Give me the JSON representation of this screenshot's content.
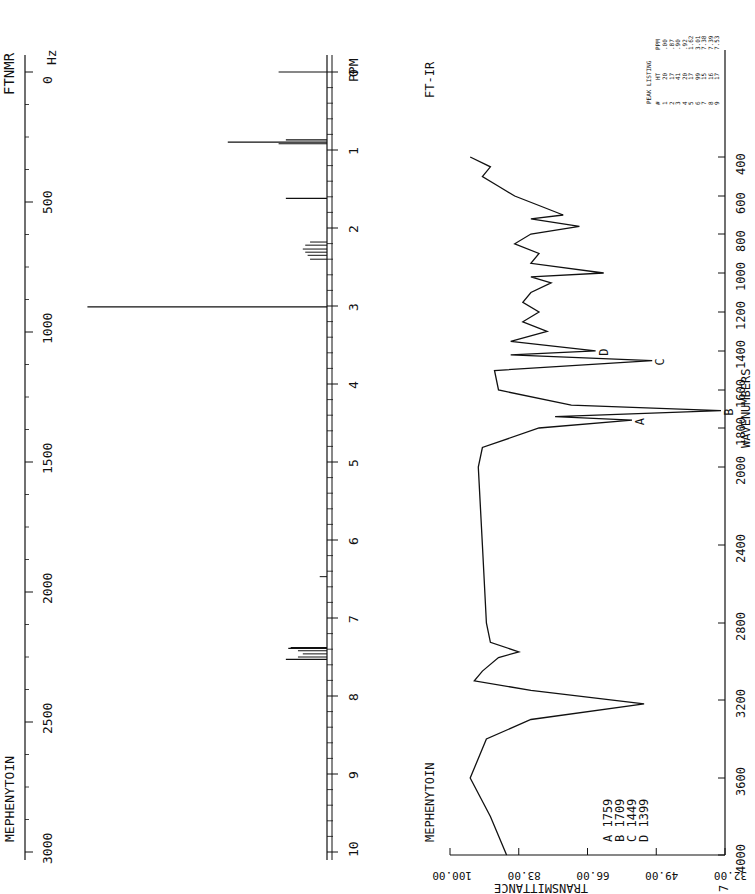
{
  "nmr": {
    "title": "FTNMR",
    "compound": "MEPHENYTOIN",
    "hz_unit": "Hz",
    "ppm_unit": "PPM",
    "hz_ticks": [
      "0",
      "500",
      "1000",
      "1500",
      "2000",
      "2500",
      "3000"
    ],
    "ppm_ticks": [
      "0",
      "1",
      "2",
      "3",
      "4",
      "5",
      "6",
      "7",
      "8",
      "9",
      "10"
    ],
    "peak_listing": {
      "title": "PEAK LISTING",
      "headers": [
        "#",
        "HT",
        "PPM"
      ],
      "rows": [
        [
          "1",
          "20",
          ".00"
        ],
        [
          "2",
          "17",
          ".87"
        ],
        [
          "3",
          "41",
          ".90"
        ],
        [
          "4",
          "20",
          ".92"
        ],
        [
          "5",
          "17",
          "1.62"
        ],
        [
          "6",
          "99",
          "3.01"
        ],
        [
          "7",
          "15",
          "7.38"
        ],
        [
          "8",
          "16",
          "7.39"
        ],
        [
          "9",
          "17",
          "7.53"
        ]
      ]
    }
  },
  "ir": {
    "title": "FT-IR",
    "compound": "MEPHENYTOIN",
    "xlabel": "WAVENUMBERS",
    "ylabel": "TRANSMITTANCE",
    "x_ticks": [
      "4000",
      "3600",
      "3200",
      "2800",
      "2400",
      "2000",
      "1800",
      "1600",
      "1400",
      "1200",
      "1000",
      "800",
      "600",
      "400"
    ],
    "y_ticks": [
      "32.00",
      "49.00",
      "66.00",
      "83.00",
      "100.00"
    ],
    "peaks": [
      {
        "label": "A",
        "wavenumber": "1759"
      },
      {
        "label": "B",
        "wavenumber": "1709"
      },
      {
        "label": "C",
        "wavenumber": "1449"
      },
      {
        "label": "D",
        "wavenumber": "1399"
      }
    ]
  },
  "corner_mark": "7",
  "chart_data": [
    {
      "type": "line",
      "title": "FTNMR — MEPHENYTOIN",
      "xlabel": "PPM",
      "x2label": "Hz",
      "xlim": [
        0,
        10
      ],
      "x2lim": [
        0,
        3000
      ],
      "grid": false,
      "peaks_ppm": [
        0.0,
        0.87,
        0.9,
        0.92,
        1.62,
        3.01,
        7.38,
        7.39,
        7.53
      ],
      "peak_heights": [
        20,
        17,
        41,
        20,
        17,
        99,
        15,
        16,
        17
      ],
      "extra_signals_ppm": [
        2.2,
        2.3,
        2.4,
        6.5
      ]
    },
    {
      "type": "line",
      "title": "FT-IR — MEPHENYTOIN",
      "xlabel": "WAVENUMBERS",
      "ylabel": "TRANSMITTANCE",
      "xlim": [
        4000,
        400
      ],
      "ylim": [
        32,
        100
      ],
      "grid": false,
      "x": [
        4000,
        3800,
        3600,
        3400,
        3300,
        3220,
        3150,
        3100,
        3050,
        2980,
        2950,
        2900,
        2800,
        2400,
        2000,
        1900,
        1800,
        1759,
        1740,
        1709,
        1680,
        1600,
        1500,
        1449,
        1420,
        1399,
        1350,
        1300,
        1250,
        1200,
        1150,
        1100,
        1050,
        1020,
        1000,
        950,
        900,
        850,
        800,
        760,
        720,
        700,
        650,
        600,
        550,
        500,
        450,
        400
      ],
      "y": [
        86,
        90,
        95,
        91,
        80,
        52,
        80,
        94,
        92,
        88,
        83,
        90,
        91,
        92,
        93,
        92,
        78,
        55,
        74,
        33,
        70,
        88,
        89,
        50,
        85,
        64,
        85,
        76,
        82,
        78,
        82,
        80,
        75,
        80,
        62,
        80,
        78,
        84,
        80,
        68,
        80,
        72,
        78,
        84,
        88,
        92,
        90,
        95
      ],
      "annotations": [
        {
          "label": "A",
          "x": 1759
        },
        {
          "label": "B",
          "x": 1709
        },
        {
          "label": "C",
          "x": 1449
        },
        {
          "label": "D",
          "x": 1399
        }
      ]
    }
  ]
}
